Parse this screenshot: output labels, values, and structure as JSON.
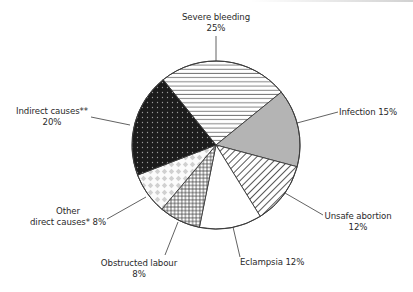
{
  "chart_data": {
    "type": "pie",
    "title": "",
    "start_angle_deg": -129,
    "direction": "clockwise",
    "center": [
      216,
      145
    ],
    "radius": 84,
    "slices": [
      {
        "label": "Severe bleeding",
        "value": 25,
        "pattern": "horizontal-lines",
        "fill": "#ffffff"
      },
      {
        "label": "Infection",
        "value": 15,
        "pattern": "solid-gray",
        "fill": "#b4b4b4"
      },
      {
        "label": "Unsafe abortion",
        "value": 12,
        "pattern": "diagonal-lines",
        "fill": "#ffffff"
      },
      {
        "label": "Eclampsia",
        "value": 12,
        "pattern": "none",
        "fill": "#ffffff"
      },
      {
        "label": "Obstructed labour",
        "value": 8,
        "pattern": "crosshatch",
        "fill": "#ffffff"
      },
      {
        "label": "Other direct causes*",
        "value": 8,
        "pattern": "light-diamonds",
        "fill": "#ffffff"
      },
      {
        "label": "Indirect causes**",
        "value": 20,
        "pattern": "dark-dotted",
        "fill": "#1c1c1c"
      }
    ],
    "legend": "none (direct labels)",
    "units": "%"
  },
  "labels": {
    "severe_bleeding": {
      "line1": "Severe bleeding",
      "line2": "25%"
    },
    "infection": {
      "line1": "Infection 15%"
    },
    "unsafe_abortion": {
      "line1": "Unsafe abortion",
      "line2": "12%"
    },
    "eclampsia": {
      "line1": "Eclampsia 12%"
    },
    "obstructed_labour": {
      "line1": "Obstructed labour",
      "line2": "8%"
    },
    "other_direct": {
      "line1": "Other",
      "line2": "direct causes* 8%"
    },
    "indirect": {
      "line1": "Indirect causes**",
      "line2": "20%"
    }
  },
  "colors": {
    "outline": "#3a3a3a",
    "text": "#2a2a2a",
    "infection_gray": "#b4b4b4",
    "indirect_dark": "#1c1c1c",
    "diamond_gray": "#d0d0d0"
  }
}
